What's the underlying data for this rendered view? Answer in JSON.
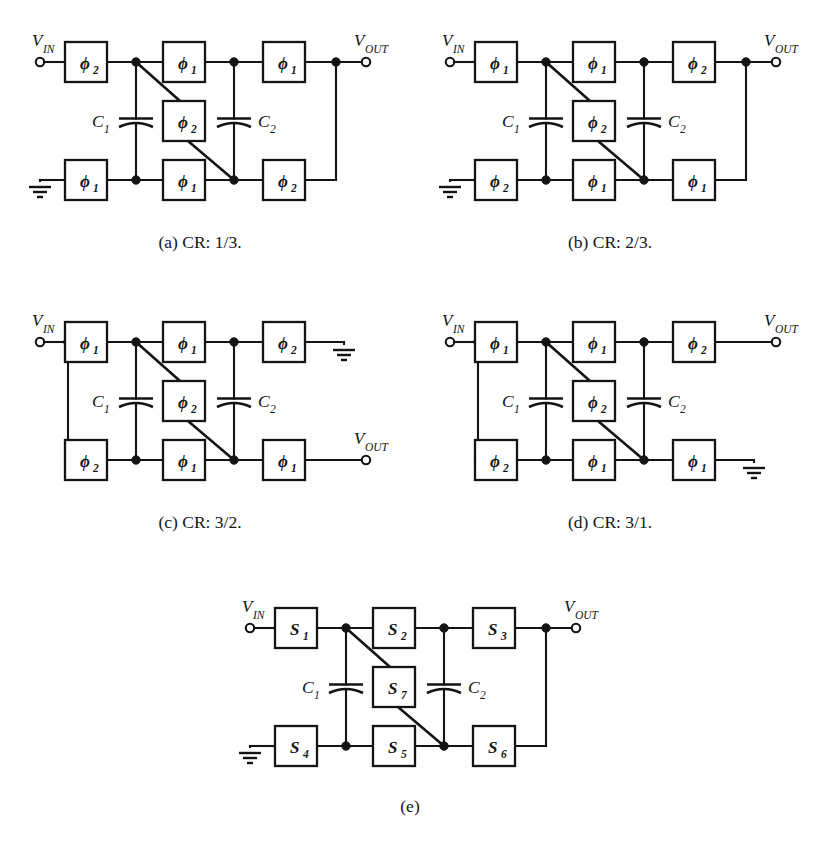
{
  "page": {
    "top_cut_text": "",
    "background": "#fefefe",
    "ink_color": "#141414"
  },
  "figures": [
    {
      "id": "a",
      "caption": "(a) CR: 1/3.",
      "vin_label": "V",
      "vin_sub": "IN",
      "vout_label": "V",
      "vout_sub": "OUT",
      "cap1_label": "C",
      "cap1_sub": "1",
      "cap2_label": "C",
      "cap2_sub": "2",
      "switches": {
        "top_left": "ϕ",
        "top_left_sub": "2",
        "top_mid": "ϕ",
        "top_mid_sub": "1",
        "top_right": "ϕ",
        "top_right_sub": "1",
        "mid": "ϕ",
        "mid_sub": "2",
        "bot_left": "ϕ",
        "bot_left_sub": "1",
        "bot_mid": "ϕ",
        "bot_mid_sub": "1",
        "bot_right": "ϕ",
        "bot_right_sub": "2"
      },
      "layout": "type1",
      "ground": "bottom-left",
      "in_side": "top-left",
      "out_side": "top-right"
    },
    {
      "id": "b",
      "caption": "(b) CR: 2/3.",
      "vin_label": "V",
      "vin_sub": "IN",
      "vout_label": "V",
      "vout_sub": "OUT",
      "cap1_label": "C",
      "cap1_sub": "1",
      "cap2_label": "C",
      "cap2_sub": "2",
      "switches": {
        "top_left": "ϕ",
        "top_left_sub": "1",
        "top_mid": "ϕ",
        "top_mid_sub": "1",
        "top_right": "ϕ",
        "top_right_sub": "2",
        "mid": "ϕ",
        "mid_sub": "2",
        "bot_left": "ϕ",
        "bot_left_sub": "2",
        "bot_mid": "ϕ",
        "bot_mid_sub": "1",
        "bot_right": "ϕ",
        "bot_right_sub": "1"
      },
      "layout": "type1",
      "ground": "bottom-left",
      "in_side": "top-left",
      "out_side": "top-right"
    },
    {
      "id": "c",
      "caption": "(c) CR: 3/2.",
      "vin_label": "V",
      "vin_sub": "IN",
      "vout_label": "V",
      "vout_sub": "OUT",
      "cap1_label": "C",
      "cap1_sub": "1",
      "cap2_label": "C",
      "cap2_sub": "2",
      "switches": {
        "top_left": "ϕ",
        "top_left_sub": "1",
        "top_mid": "ϕ",
        "top_mid_sub": "1",
        "top_right": "ϕ",
        "top_right_sub": "2",
        "mid": "ϕ",
        "mid_sub": "2",
        "bot_left": "ϕ",
        "bot_left_sub": "2",
        "bot_mid": "ϕ",
        "bot_mid_sub": "1",
        "bot_right": "ϕ",
        "bot_right_sub": "1"
      },
      "layout": "type2",
      "ground": "top-right",
      "in_side": "top-left",
      "out_side": "bottom-right"
    },
    {
      "id": "d",
      "caption": "(d) CR: 3/1.",
      "vin_label": "V",
      "vin_sub": "IN",
      "vout_label": "V",
      "vout_sub": "OUT",
      "cap1_label": "C",
      "cap1_sub": "1",
      "cap2_label": "C",
      "cap2_sub": "2",
      "switches": {
        "top_left": "ϕ",
        "top_left_sub": "1",
        "top_mid": "ϕ",
        "top_mid_sub": "1",
        "top_right": "ϕ",
        "top_right_sub": "2",
        "mid": "ϕ",
        "mid_sub": "2",
        "bot_left": "ϕ",
        "bot_left_sub": "2",
        "bot_mid": "ϕ",
        "bot_mid_sub": "1",
        "bot_right": "ϕ",
        "bot_right_sub": "1"
      },
      "layout": "type3",
      "ground": "bottom-right",
      "in_side": "top-left",
      "out_side": "top-right"
    },
    {
      "id": "e",
      "caption": "(e)",
      "vin_label": "V",
      "vin_sub": "IN",
      "vout_label": "V",
      "vout_sub": "OUT",
      "cap1_label": "C",
      "cap1_sub": "1",
      "cap2_label": "C",
      "cap2_sub": "2",
      "switches": {
        "top_left": "S",
        "top_left_sub": "1",
        "top_mid": "S",
        "top_mid_sub": "2",
        "top_right": "S",
        "top_right_sub": "3",
        "mid": "S",
        "mid_sub": "7",
        "bot_left": "S",
        "bot_left_sub": "4",
        "bot_mid": "S",
        "bot_mid_sub": "5",
        "bot_right": "S",
        "bot_right_sub": "6"
      },
      "layout": "type1",
      "ground": "bottom-left",
      "in_side": "top-left",
      "out_side": "top-right"
    }
  ]
}
